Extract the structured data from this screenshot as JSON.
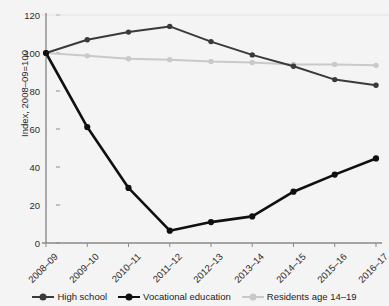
{
  "title_clipped": "",
  "axes": {
    "ylabel": "Index, 2008–09=100",
    "yticks": [
      "0",
      "20",
      "40",
      "60",
      "80",
      "100",
      "120"
    ],
    "xticks": [
      "2008–09",
      "2009–10",
      "2010–11",
      "2011–12",
      "2012–13",
      "2013–14",
      "2014–15",
      "2015–16",
      "2016–17"
    ]
  },
  "legend": {
    "items": [
      {
        "label": "High school",
        "color": "#3a3a3a"
      },
      {
        "label": "Vocational education",
        "color": "#101010"
      },
      {
        "label": "Residents age 14–19",
        "color": "#c9c9c9"
      }
    ]
  },
  "chart_data": {
    "type": "line",
    "title": "",
    "xlabel": "",
    "ylabel": "Index, 2008–09=100",
    "categories": [
      "2008–09",
      "2009–10",
      "2010–11",
      "2011–12",
      "2012–13",
      "2013–14",
      "2014–15",
      "2015–16",
      "2016–17"
    ],
    "ylim": [
      0,
      120
    ],
    "ytick_values": [
      0,
      20,
      40,
      60,
      80,
      100,
      120
    ],
    "grid": false,
    "legend_position": "bottom",
    "series": [
      {
        "name": "High school",
        "color": "#3a3a3a",
        "values": [
          100,
          107,
          111,
          114,
          106,
          99,
          93,
          86,
          83
        ]
      },
      {
        "name": "Vocational education",
        "color": "#101010",
        "values": [
          100,
          61,
          29,
          6.5,
          11,
          14,
          27,
          36,
          44.5
        ]
      },
      {
        "name": "Residents age 14–19",
        "color": "#c9c9c9",
        "values": [
          100,
          98.5,
          97,
          96.5,
          95.5,
          95,
          94,
          94,
          93.5
        ]
      }
    ]
  }
}
